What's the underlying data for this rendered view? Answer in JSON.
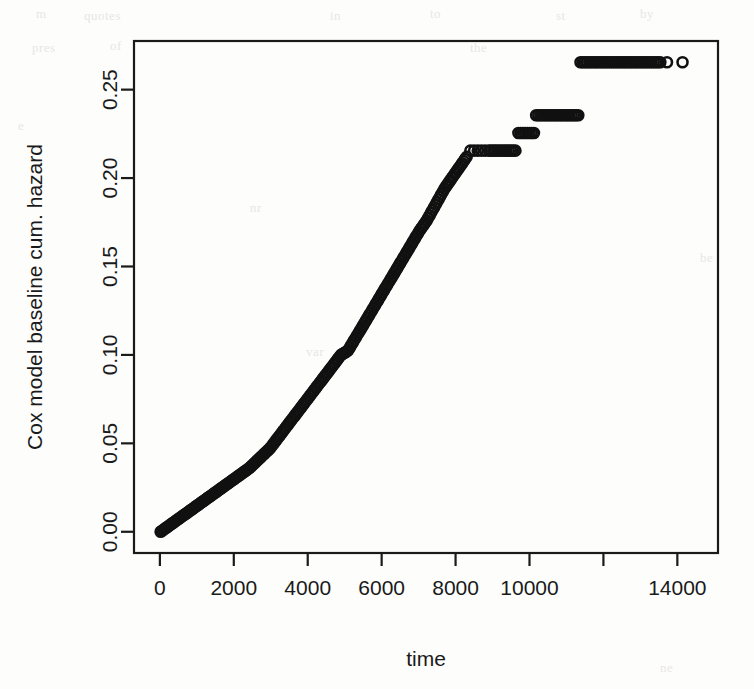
{
  "figure": {
    "width": 754,
    "height": 689,
    "background_color": "#fdfdfc",
    "ink_color": "#1a1a1a",
    "scan_artifact_color": "#e8e7e4"
  },
  "chart_data": {
    "type": "scatter",
    "title": "",
    "subtitle": "",
    "xlabel": "time",
    "ylabel": "Cox model baseline cum. hazard",
    "xlim": [
      -700,
      15100
    ],
    "ylim": [
      -0.012,
      0.2775
    ],
    "xticks": [
      0,
      2000,
      4000,
      6000,
      8000,
      10000,
      12000,
      14000
    ],
    "xticklabels": [
      "0",
      "2000",
      "4000",
      "6000",
      "8000",
      "10000",
      "",
      "14000"
    ],
    "yticks": [
      0.0,
      0.05,
      0.1,
      0.15,
      0.2,
      0.25
    ],
    "yticklabels": [
      "0.00",
      "0.05",
      "0.10",
      "0.15",
      "0.20",
      "0.25"
    ],
    "grid": false,
    "legend": null,
    "box": true,
    "marker": "open-circle",
    "marker_size": 5,
    "marker_color": "#111111",
    "series": [
      {
        "name": "baseline cumulative hazard",
        "x": [
          20,
          60,
          100,
          140,
          180,
          220,
          260,
          300,
          340,
          380,
          420,
          460,
          500,
          540,
          580,
          620,
          660,
          700,
          740,
          780,
          820,
          860,
          900,
          940,
          980,
          1020,
          1060,
          1100,
          1140,
          1180,
          1220,
          1260,
          1300,
          1340,
          1380,
          1420,
          1460,
          1500,
          1540,
          1580,
          1620,
          1660,
          1700,
          1740,
          1780,
          1820,
          1860,
          1900,
          1940,
          1980,
          2020,
          2060,
          2100,
          2140,
          2180,
          2220,
          2260,
          2300,
          2340,
          2380,
          2420,
          2460,
          2500,
          2540,
          2580,
          2620,
          2660,
          2700,
          2740,
          2780,
          2820,
          2860,
          2900,
          2940,
          2980,
          3020,
          3060,
          3100,
          3140,
          3180,
          3220,
          3260,
          3300,
          3340,
          3380,
          3420,
          3460,
          3500,
          3540,
          3580,
          3620,
          3660,
          3700,
          3740,
          3780,
          3820,
          3860,
          3900,
          3940,
          3980,
          4020,
          4060,
          4100,
          4140,
          4180,
          4220,
          4260,
          4300,
          4340,
          4380,
          4420,
          4460,
          4500,
          4540,
          4580,
          4620,
          4660,
          4700,
          4740,
          4780,
          4820,
          4860,
          4900,
          4940,
          4980,
          5020,
          5060,
          5100,
          5140,
          5180,
          5220,
          5260,
          5300,
          5340,
          5380,
          5420,
          5460,
          5500,
          5540,
          5580,
          5620,
          5660,
          5700,
          5740,
          5780,
          5820,
          5860,
          5900,
          5940,
          5980,
          6020,
          6060,
          6100,
          6140,
          6180,
          6220,
          6260,
          6300,
          6340,
          6380,
          6420,
          6460,
          6500,
          6540,
          6580,
          6620,
          6660,
          6700,
          6740,
          6780,
          6820,
          6860,
          6900,
          6940,
          6980,
          7020,
          7060,
          7100,
          7140,
          7180,
          7220,
          7260,
          7300,
          7340,
          7380,
          7420,
          7460,
          7500,
          7540,
          7580,
          7620,
          7660,
          7700,
          7740,
          7780,
          7820,
          7860,
          7900,
          7940,
          7980,
          8020,
          8060,
          8100,
          8140,
          8180,
          8220,
          8260,
          8300,
          8400,
          8500,
          8600,
          8700,
          8800,
          8900,
          8960,
          9020,
          9080,
          9140,
          9200,
          9260,
          9320,
          9380,
          9440,
          9500,
          9560,
          9620,
          9700,
          9760,
          9820,
          9880,
          9940,
          10000,
          10060,
          10120,
          10180,
          10240,
          10300,
          10360,
          10420,
          10480,
          10540,
          10600,
          10660,
          10720,
          10780,
          10840,
          10900,
          10960,
          11020,
          11080,
          11140,
          11200,
          11260,
          11320,
          11380,
          11440,
          11500,
          11560,
          11620,
          11680,
          11740,
          11800,
          11860,
          11920,
          11980,
          12040,
          12100,
          12160,
          12220,
          12280,
          12340,
          12400,
          12460,
          12520,
          12580,
          12640,
          12700,
          12760,
          12820,
          12880,
          12940,
          13000,
          13060,
          13120,
          13180,
          13240,
          13300,
          13360,
          13420,
          13480,
          13540,
          13720,
          14140
        ],
        "y": [
          0.0,
          0.0006,
          0.0012,
          0.0018,
          0.0024,
          0.003,
          0.0036,
          0.0042,
          0.0048,
          0.0054,
          0.006,
          0.0066,
          0.0072,
          0.0078,
          0.0084,
          0.009,
          0.0096,
          0.0102,
          0.0108,
          0.0114,
          0.012,
          0.0126,
          0.0132,
          0.0138,
          0.0144,
          0.015,
          0.0156,
          0.0162,
          0.0168,
          0.0174,
          0.018,
          0.0186,
          0.0192,
          0.0198,
          0.0204,
          0.021,
          0.0216,
          0.0222,
          0.0228,
          0.0234,
          0.024,
          0.0246,
          0.0252,
          0.0258,
          0.0264,
          0.027,
          0.0276,
          0.0282,
          0.0288,
          0.0294,
          0.03,
          0.0306,
          0.0312,
          0.0318,
          0.0324,
          0.033,
          0.0336,
          0.0342,
          0.0348,
          0.0354,
          0.036,
          0.0368,
          0.0376,
          0.0384,
          0.0392,
          0.04,
          0.0408,
          0.0416,
          0.0424,
          0.0432,
          0.044,
          0.0448,
          0.0456,
          0.0464,
          0.0472,
          0.0483,
          0.0494,
          0.0505,
          0.0516,
          0.0527,
          0.0538,
          0.0549,
          0.056,
          0.0571,
          0.0582,
          0.0593,
          0.0604,
          0.0615,
          0.0626,
          0.0637,
          0.0648,
          0.0659,
          0.067,
          0.0681,
          0.0692,
          0.0703,
          0.0714,
          0.0725,
          0.0736,
          0.0747,
          0.0758,
          0.0769,
          0.078,
          0.0791,
          0.0802,
          0.0813,
          0.0824,
          0.0835,
          0.0846,
          0.0857,
          0.0868,
          0.0879,
          0.089,
          0.0901,
          0.0912,
          0.0923,
          0.0934,
          0.0945,
          0.0956,
          0.0967,
          0.0978,
          0.0989,
          0.1,
          0.1005,
          0.101,
          0.1015,
          0.102,
          0.1028,
          0.1042,
          0.1056,
          0.107,
          0.1084,
          0.1098,
          0.1112,
          0.1126,
          0.114,
          0.1154,
          0.1168,
          0.1182,
          0.1196,
          0.121,
          0.1224,
          0.1238,
          0.1252,
          0.1266,
          0.128,
          0.1294,
          0.1308,
          0.1322,
          0.1336,
          0.135,
          0.1364,
          0.1378,
          0.1392,
          0.1406,
          0.142,
          0.1434,
          0.1448,
          0.1462,
          0.1476,
          0.149,
          0.1504,
          0.1518,
          0.1532,
          0.1546,
          0.156,
          0.1574,
          0.1588,
          0.1602,
          0.1616,
          0.163,
          0.1644,
          0.1658,
          0.1672,
          0.1686,
          0.17,
          0.1712,
          0.1724,
          0.1736,
          0.1748,
          0.176,
          0.1775,
          0.179,
          0.1805,
          0.182,
          0.1835,
          0.185,
          0.1865,
          0.188,
          0.1895,
          0.191,
          0.1925,
          0.194,
          0.1952,
          0.1964,
          0.1976,
          0.1988,
          0.2,
          0.2012,
          0.2024,
          0.2036,
          0.2048,
          0.206,
          0.2072,
          0.2084,
          0.2096,
          0.2108,
          0.212,
          0.2155,
          0.2155,
          0.2155,
          0.2155,
          0.2155,
          0.2155,
          0.2155,
          0.2155,
          0.2155,
          0.2155,
          0.2155,
          0.2155,
          0.2155,
          0.2155,
          0.2155,
          0.2155,
          0.2155,
          0.2155,
          0.2255,
          0.2255,
          0.2255,
          0.2255,
          0.2255,
          0.2255,
          0.2255,
          0.2255,
          0.2355,
          0.2355,
          0.2355,
          0.2355,
          0.2355,
          0.2355,
          0.2355,
          0.2355,
          0.2355,
          0.2355,
          0.2355,
          0.2355,
          0.2355,
          0.2355,
          0.2355,
          0.2355,
          0.2355,
          0.2355,
          0.2355,
          0.2355,
          0.2655,
          0.2655,
          0.2655,
          0.2655,
          0.2655,
          0.2655,
          0.2655,
          0.2655,
          0.2655,
          0.2655,
          0.2655,
          0.2655,
          0.2655,
          0.2655,
          0.2655,
          0.2655,
          0.2655,
          0.2655,
          0.2655,
          0.2655,
          0.2655,
          0.2655,
          0.2655,
          0.2655,
          0.2655,
          0.2655,
          0.2655,
          0.2655,
          0.2655,
          0.2655,
          0.2655,
          0.2655,
          0.2655,
          0.2655,
          0.2655,
          0.2655,
          0.2655,
          0.2655,
          0.2655
        ]
      }
    ]
  },
  "scan_artifacts": [
    {
      "text": "m",
      "x": 36,
      "y": 6
    },
    {
      "text": "quotes",
      "x": 84,
      "y": 8
    },
    {
      "text": "in",
      "x": 330,
      "y": 8
    },
    {
      "text": "to",
      "x": 430,
      "y": 6
    },
    {
      "text": "st",
      "x": 556,
      "y": 8
    },
    {
      "text": "by",
      "x": 640,
      "y": 6
    },
    {
      "text": "pres",
      "x": 32,
      "y": 40
    },
    {
      "text": "of",
      "x": 110,
      "y": 38
    },
    {
      "text": "the",
      "x": 470,
      "y": 40
    },
    {
      "text": "e",
      "x": 18,
      "y": 118
    },
    {
      "text": "nr",
      "x": 250,
      "y": 200
    },
    {
      "text": "var",
      "x": 306,
      "y": 344
    },
    {
      "text": "be",
      "x": 700,
      "y": 250
    },
    {
      "text": "ne",
      "x": 660,
      "y": 660
    }
  ]
}
